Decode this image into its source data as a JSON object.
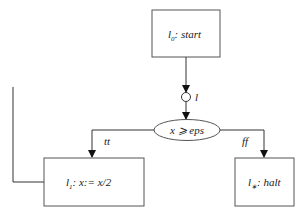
{
  "diagram": {
    "nodes": {
      "start": {
        "label_main": "l",
        "label_sub": "0",
        "label_rest": ": start"
      },
      "junction": {
        "label": "l"
      },
      "condition": {
        "label": "x ⩾ eps"
      },
      "divide": {
        "label_main": "l",
        "label_sub": "1",
        "label_rest": ": x:= x/2"
      },
      "halt": {
        "label_main": "l",
        "label_sub": "∗",
        "label_rest": ": halt"
      }
    },
    "edges": {
      "true_label": "tt",
      "false_label": "ff"
    },
    "colors": {
      "stroke": "#555555",
      "text": "#222222",
      "background": "#ffffff"
    }
  }
}
